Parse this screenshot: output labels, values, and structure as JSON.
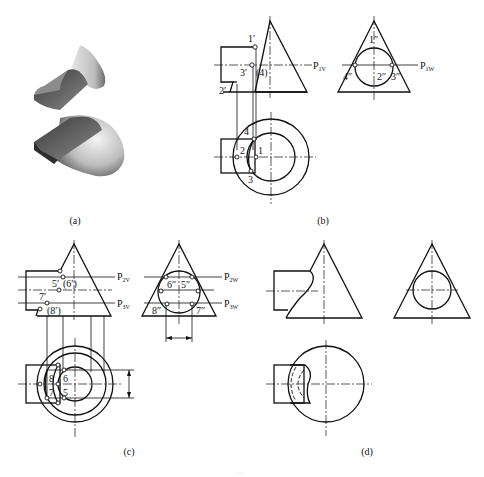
{
  "figure": {
    "panels": [
      {
        "id": "a",
        "caption": "(a)",
        "description": "shaded 3D render of cone with cylindrical cut-through"
      },
      {
        "id": "b",
        "caption": "(b)"
      },
      {
        "id": "c",
        "caption": "(c)"
      },
      {
        "id": "d",
        "caption": "(d)"
      }
    ],
    "labels_b": {
      "front": [
        "1′",
        "3′",
        "(4)",
        "2′"
      ],
      "side": [
        "1″",
        "4″",
        "2″",
        "3″"
      ],
      "top": [
        "4",
        "2",
        "1",
        "3"
      ],
      "planes": {
        "front": "P",
        "front_sub": "1V",
        "side": "P",
        "side_sub": "1W"
      }
    },
    "labels_c": {
      "front": [
        "5′",
        "(6′)",
        "7′",
        "(8′)"
      ],
      "side": [
        "6″",
        "5″",
        "8″",
        "7″"
      ],
      "top": [
        "8",
        "6",
        "7",
        "5"
      ],
      "planes": {
        "front_2": "P",
        "front_2_sub": "2V",
        "front_3": "P",
        "front_3_sub": "3V",
        "side_2": "P",
        "side_2_sub": "2W",
        "side_3": "P",
        "side_3_sub": "3W"
      }
    },
    "bottom_caption": "…"
  }
}
